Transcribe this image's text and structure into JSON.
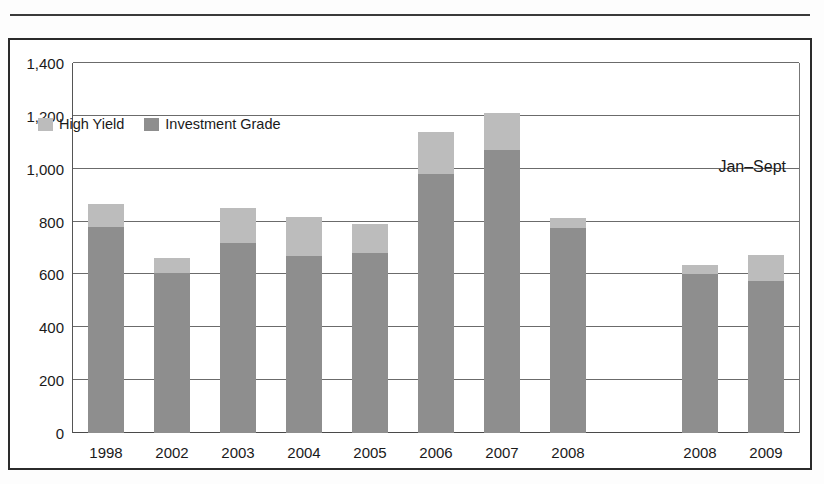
{
  "figure": {
    "annotation": "Jan–Sept",
    "frame_color": "#2b2b2b",
    "rule_color": "#3a3a3a"
  },
  "chart_data": {
    "type": "bar",
    "subtype": "stacked-column",
    "title": "",
    "subtitle": "",
    "xlabel": "",
    "ylabel": "",
    "ylim": [
      0,
      1400
    ],
    "ytick_values": [
      0,
      200,
      400,
      600,
      800,
      1000,
      1200,
      1400
    ],
    "ytick_labels": [
      "0",
      "200",
      "400",
      "600",
      "800",
      "1,000",
      "1,200",
      "1,400"
    ],
    "grid": true,
    "grid_axis": "y",
    "legend_position": "upper-left-inside",
    "annotations": [
      {
        "text": "Jan–Sept",
        "position": "upper-right-inside"
      }
    ],
    "categories": [
      "1998",
      "2002",
      "2003",
      "2004",
      "2005",
      "2006",
      "2007",
      "2008",
      "",
      "2008",
      "2009"
    ],
    "series": [
      {
        "name": "Investment Grade",
        "color": "#8e8e8e",
        "values": [
          780,
          605,
          720,
          670,
          680,
          980,
          1070,
          775,
          null,
          602,
          575
        ]
      },
      {
        "name": "High Yield",
        "color": "#bcbcbc",
        "values": [
          85,
          58,
          130,
          148,
          110,
          160,
          140,
          37,
          null,
          33,
          97
        ]
      }
    ],
    "totals": [
      865,
      663,
      850,
      818,
      790,
      1140,
      1210,
      812,
      null,
      635,
      672
    ]
  },
  "legend": {
    "entries": [
      {
        "label": "High Yield",
        "swatch": "high"
      },
      {
        "label": "Investment Grade",
        "swatch": "ig"
      }
    ]
  }
}
